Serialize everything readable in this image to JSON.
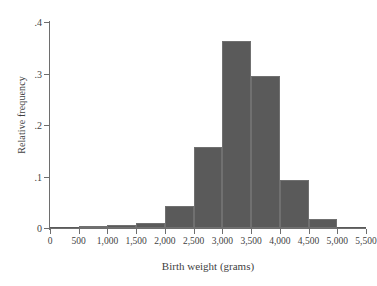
{
  "chart_data": {
    "type": "bar",
    "title": "",
    "xlabel": "Birth weight (grams)",
    "ylabel": "Relative frequency",
    "xlim": [
      0,
      5500
    ],
    "ylim": [
      0,
      0.4
    ],
    "grid": false,
    "legend": null,
    "bin_width": 500,
    "categories": [
      "0-500",
      "500-1,000",
      "1,000-1,500",
      "1,500-2,000",
      "2,000-2,500",
      "2,500-3,000",
      "3,000-3,500",
      "3,500-4,000",
      "4,000-4,500",
      "4,500-5,000",
      "5,000-5,500"
    ],
    "bin_starts": [
      0,
      500,
      1000,
      1500,
      2000,
      2500,
      3000,
      3500,
      4000,
      4500,
      5000
    ],
    "values": [
      0.0,
      0.004,
      0.005,
      0.01,
      0.043,
      0.157,
      0.364,
      0.295,
      0.093,
      0.017,
      0.001
    ],
    "xticks": [
      0,
      500,
      1000,
      1500,
      2000,
      2500,
      3000,
      3500,
      4000,
      4500,
      5000,
      5500
    ],
    "xtick_labels": [
      "0",
      "500",
      "1,000",
      "1,500",
      "2,000",
      "2,500",
      "3,000",
      "3,500",
      "4,000",
      "4,500",
      "5,000",
      "5,500"
    ],
    "yticks": [
      0,
      0.1,
      0.2,
      0.3,
      0.4
    ],
    "ytick_labels": [
      "0",
      ".1",
      ".2",
      ".3",
      ".4"
    ],
    "bar_color": "#5a5a5a",
    "axis_color": "#6e6e6e",
    "background_color": "#ffffff"
  }
}
